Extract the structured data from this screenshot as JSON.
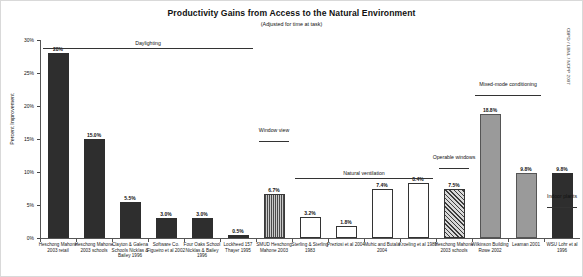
{
  "chart_data": {
    "type": "bar",
    "title": "Productivity Gains from Access to the Natural Environment",
    "subtitle": "(Adjusted for time at task)",
    "xlabel": "",
    "ylabel": "Percent Improvement",
    "ylim": [
      0,
      30
    ],
    "yticks": [
      "0%",
      "5%",
      "10%",
      "15%",
      "20%",
      "25%",
      "30%"
    ],
    "ytick_values": [
      0,
      5,
      10,
      15,
      20,
      25,
      30
    ],
    "grid": false,
    "legend": "none",
    "credit": "CBPD / LBNL / NCPP 2007",
    "categories": [
      "Heschong Mahone 2003 retail",
      "Heschong Mahone 2003 schools",
      "Clayton & Galena Schools Nicklas & Bailey 1996",
      "Software Co. Figueiro et al 2002",
      "Four Oaks School Nicklas & Bailey 1996",
      "Lockheed 157 Thayer 1995",
      "SMUD Heschong Mahone 2003",
      "Sterling & Sterling 1983",
      "Preziosi et al 2004",
      "Muhic and Butala 2004",
      "Kroeling et al 1989",
      "Heschong Mahone 2003 schools",
      "Wilkinson Building Rowe 2002",
      "Leaman 2001",
      "WSU Lohr et al 1996"
    ],
    "values": [
      28.0,
      15.0,
      5.5,
      3.0,
      3.0,
      0.5,
      6.7,
      3.2,
      1.8,
      7.4,
      8.4,
      7.5,
      18.8,
      9.8,
      9.8
    ],
    "value_labels": [
      "28%",
      "15.0%",
      "5.5%",
      "3.0%",
      "3.0%",
      "0.5%",
      "6.7%",
      "3.2%",
      "1.8%",
      "7.4%",
      "8.4%",
      "7.5%",
      "18.8%",
      "9.8%",
      "9.8%"
    ],
    "patterns": [
      "solid",
      "solid",
      "solid",
      "solid",
      "solid",
      "solid",
      "vstripe",
      "open",
      "open",
      "open",
      "open",
      "hatch",
      "dotted",
      "dotted",
      "solid"
    ],
    "groups": [
      {
        "label": "Daylighting",
        "start": 0,
        "end": 5
      },
      {
        "label": "Window view",
        "start": 6,
        "end": 6
      },
      {
        "label": "Natural ventilation",
        "start": 7,
        "end": 10
      },
      {
        "label": "Operable windows",
        "start": 11,
        "end": 11
      },
      {
        "label": "Mixed-mode conditioning",
        "start": 12,
        "end": 13
      },
      {
        "label": "Indoor plants",
        "start": 14,
        "end": 14
      }
    ]
  }
}
